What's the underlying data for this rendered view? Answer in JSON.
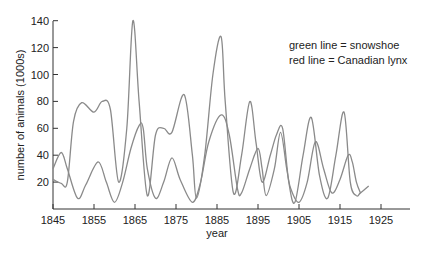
{
  "chart_data": {
    "type": "line",
    "title": "",
    "xlabel": "year",
    "ylabel": "number of animals (1000s)",
    "xlim": [
      1845,
      1930
    ],
    "ylim": [
      0,
      140
    ],
    "x_ticks": [
      1845,
      1855,
      1865,
      1875,
      1885,
      1895,
      1905,
      1915,
      1925
    ],
    "y_ticks": [
      20,
      40,
      60,
      80,
      100,
      120,
      140
    ],
    "grid": false,
    "legend_position": "upper right (text annotation)",
    "annotations": [
      "green line = snowshoe",
      "red line = Canadian lynx"
    ],
    "series": [
      {
        "name": "snowshoe",
        "color": "#8a8a8a",
        "points": [
          [
            1845,
            22
          ],
          [
            1847,
            19
          ],
          [
            1848.5,
            20
          ],
          [
            1850,
            65
          ],
          [
            1852,
            79
          ],
          [
            1855,
            72
          ],
          [
            1857,
            80
          ],
          [
            1859,
            74
          ],
          [
            1861,
            20
          ],
          [
            1863,
            60
          ],
          [
            1864.5,
            140
          ],
          [
            1866,
            80
          ],
          [
            1868,
            10
          ],
          [
            1870,
            55
          ],
          [
            1872,
            60
          ],
          [
            1874,
            57
          ],
          [
            1877,
            85
          ],
          [
            1879,
            40
          ],
          [
            1880,
            8
          ],
          [
            1882,
            40
          ],
          [
            1884,
            100
          ],
          [
            1886,
            128
          ],
          [
            1887,
            80
          ],
          [
            1889,
            12
          ],
          [
            1891,
            40
          ],
          [
            1893,
            80
          ],
          [
            1894.5,
            50
          ],
          [
            1896,
            20
          ],
          [
            1898,
            40
          ],
          [
            1899.5,
            55
          ],
          [
            1901,
            60
          ],
          [
            1902.5,
            20
          ],
          [
            1904,
            5
          ],
          [
            1906,
            40
          ],
          [
            1908,
            68
          ],
          [
            1910,
            25
          ],
          [
            1912,
            8
          ],
          [
            1914,
            40
          ],
          [
            1916,
            72
          ],
          [
            1917.5,
            20
          ],
          [
            1919,
            10
          ],
          [
            1920,
            12
          ],
          [
            1922,
            17
          ]
        ]
      },
      {
        "name": "Canadian lynx",
        "color": "#8a8a8a",
        "points": [
          [
            1845,
            30
          ],
          [
            1847,
            42
          ],
          [
            1848.5,
            30
          ],
          [
            1851,
            8
          ],
          [
            1853,
            18
          ],
          [
            1856,
            35
          ],
          [
            1858,
            20
          ],
          [
            1860,
            5
          ],
          [
            1862,
            20
          ],
          [
            1864,
            45
          ],
          [
            1866,
            62
          ],
          [
            1867,
            60
          ],
          [
            1868,
            30
          ],
          [
            1870,
            8
          ],
          [
            1872,
            20
          ],
          [
            1874,
            38
          ],
          [
            1876,
            22
          ],
          [
            1879,
            5
          ],
          [
            1881,
            20
          ],
          [
            1883,
            50
          ],
          [
            1886,
            70
          ],
          [
            1888,
            55
          ],
          [
            1890,
            15
          ],
          [
            1891,
            12
          ],
          [
            1893,
            30
          ],
          [
            1895,
            45
          ],
          [
            1896,
            30
          ],
          [
            1897,
            10
          ],
          [
            1899,
            30
          ],
          [
            1900.5,
            57
          ],
          [
            1902,
            30
          ],
          [
            1903,
            15
          ],
          [
            1905,
            5
          ],
          [
            1907,
            20
          ],
          [
            1909,
            50
          ],
          [
            1911,
            30
          ],
          [
            1913,
            12
          ],
          [
            1915,
            22
          ],
          [
            1917,
            40
          ],
          [
            1918,
            35
          ],
          [
            1919,
            20
          ],
          [
            1920,
            12
          ]
        ]
      }
    ]
  },
  "legend": {
    "line1": "green line = snowshoe",
    "line2": "red line = Canadian lynx"
  },
  "axes": {
    "xlabel": "year",
    "ylabel": "number of animals (1000s)"
  }
}
